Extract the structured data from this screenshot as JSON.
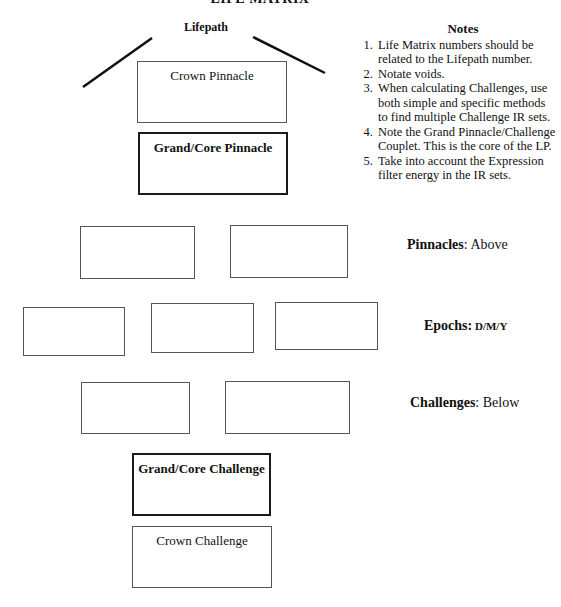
{
  "document": {
    "title": "LIFE MATRIX",
    "lifepath_label": "Lifepath"
  },
  "pinnacle_stack": {
    "crown_pinnacle": "Crown Pinnacle",
    "grand_core_pinnacle": "Grand/Core Pinnacle"
  },
  "notes": {
    "title": "Notes",
    "items": [
      "Life Matrix numbers should be related to the Lifepath number.",
      "Notate voids.",
      "When calculating Challenges, use both simple and specific methods to find multiple Challenge IR sets.",
      "Note the Grand Pinnacle/Challenge Couplet. This is the core of the LP.",
      "Take into account the Expression filter energy in the IR sets."
    ]
  },
  "rows": {
    "pinnacles": {
      "label_bold": "Pinnacles",
      "label_rest": ": Above",
      "boxes": [
        "",
        ""
      ]
    },
    "epochs": {
      "label_bold": "Epochs:",
      "label_rest": " D/M/Y",
      "boxes": [
        "",
        "",
        ""
      ]
    },
    "challenges": {
      "label_bold": "Challenges",
      "label_rest": ": Below",
      "boxes": [
        "",
        ""
      ]
    }
  },
  "challenge_stack": {
    "grand_core_challenge": "Grand/Core Challenge",
    "crown_challenge": "Crown Challenge"
  }
}
